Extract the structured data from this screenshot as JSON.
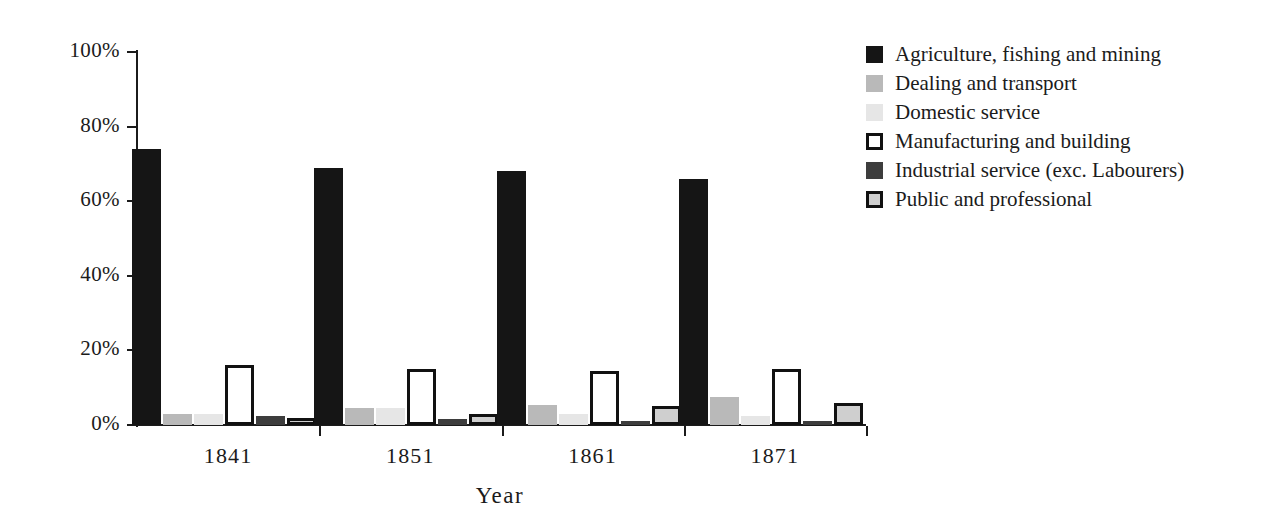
{
  "chart_data": {
    "type": "bar",
    "title": "",
    "subtitle": "",
    "xlabel": "Year",
    "ylabel": "",
    "categories": [
      "1841",
      "1851",
      "1861",
      "1871"
    ],
    "ylim": [
      0,
      100
    ],
    "ytick_labels": [
      "0%",
      "20%",
      "40%",
      "60%",
      "80%",
      "100%"
    ],
    "ytick_values": [
      0,
      20,
      40,
      60,
      80,
      100
    ],
    "grid": false,
    "legend_position": "right",
    "value_suffix": "%",
    "series": [
      {
        "name": "Agriculture, fishing and mining",
        "swatch": "solid-dark",
        "color": "#151515",
        "values": [
          74,
          69,
          68,
          66
        ]
      },
      {
        "name": "Dealing and transport",
        "swatch": "solid-medium-gray",
        "color": "#b9b9b9",
        "values": [
          3,
          4.5,
          5.5,
          7.5
        ]
      },
      {
        "name": "Domestic service",
        "swatch": "solid-light-gray",
        "color": "#e6e6e6",
        "values": [
          3,
          4.5,
          3,
          2.5
        ]
      },
      {
        "name": "Manufacturing and building",
        "swatch": "outlined-white",
        "color": "#ffffff",
        "values": [
          16,
          15,
          14.5,
          15
        ]
      },
      {
        "name": "Industrial service (exc. Labourers)",
        "swatch": "solid-dark-gray",
        "color": "#3d3d3d",
        "values": [
          2.5,
          1.5,
          1,
          1
        ]
      },
      {
        "name": "Public and professional",
        "swatch": "outlined-gray",
        "color": "#cfcfcf",
        "values": [
          2,
          3,
          5,
          6
        ]
      }
    ]
  },
  "axis": {
    "x_title": "Year"
  }
}
